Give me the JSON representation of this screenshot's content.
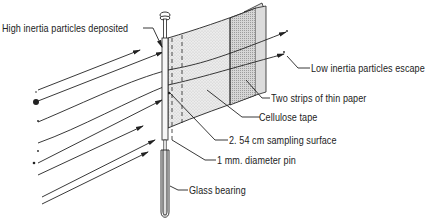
{
  "diagram": {
    "type": "schematic",
    "colors": {
      "line": "#222222",
      "paper_fill": "#e6e6e6",
      "strip_fill": "#cfcfcf",
      "background": "#ffffff"
    },
    "labels": {
      "high_inertia": "High inertia particles deposited",
      "low_inertia": "Low inertia particles escape",
      "paper_strips": "Two strips of thin paper",
      "cellulose_tape": "Cellulose tape",
      "sampling_surface": "2. 54 cm sampling surface",
      "pin": "1 mm. diameter pin",
      "glass_bearing": "Glass bearing"
    },
    "components": [
      {
        "name": "pin",
        "description": "1 mm diameter vertical pin with round head"
      },
      {
        "name": "glass_bearing",
        "description": "Glass tube holding the pin base"
      },
      {
        "name": "cellulose_tape",
        "description": "Tape strip along pin (dashed region)"
      },
      {
        "name": "paper_strips",
        "description": "Two strips of thin paper forming a vane"
      },
      {
        "name": "particle_trajectories",
        "description": "Arrowed streamlines approaching the pin; high inertia particles hit, low inertia particles follow flow around"
      }
    ]
  }
}
